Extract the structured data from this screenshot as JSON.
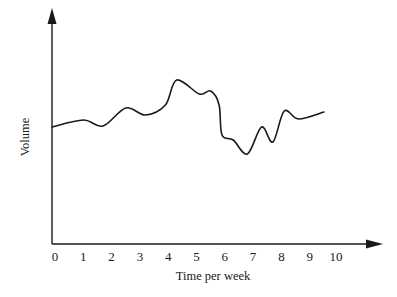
{
  "chart_data": {
    "type": "line",
    "title": "",
    "xlabel": "Time per week",
    "ylabel": "Volume",
    "x_ticks": [
      "0",
      "1",
      "2",
      "3",
      "4",
      "5",
      "6",
      "7",
      "8",
      "9",
      "10"
    ],
    "y_ticks": [],
    "xlim": [
      0,
      11
    ],
    "ylim": [
      0,
      235
    ],
    "grid": false,
    "legend": null,
    "series": [
      {
        "name": "Volume",
        "color": "#1a1a1a",
        "x": [
          0.0,
          1.0,
          1.7,
          2.5,
          3.2,
          3.9,
          4.3,
          5.1,
          5.5,
          5.8,
          5.9,
          6.3,
          6.8,
          7.3,
          7.7,
          8.1,
          8.6,
          9.5
        ],
        "values": [
          117,
          124,
          118,
          136,
          129,
          139,
          164,
          150,
          153,
          139,
          109,
          104,
          90,
          117,
          102,
          133,
          125,
          132
        ]
      }
    ]
  },
  "axes": {
    "x_title": "Time per week",
    "y_title": "Volume"
  },
  "colors": {
    "line": "#1a1a1a",
    "axis": "#1a1a1a",
    "background": "#ffffff"
  }
}
